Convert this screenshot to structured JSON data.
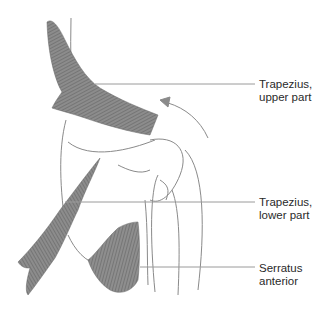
{
  "diagram": {
    "colors": {
      "muscle": "#7a7a7a",
      "outline": "#8a8a8a",
      "leader": "#9a9a9a",
      "text": "#2a2a2a"
    },
    "labels": [
      {
        "id": "trapezius-upper",
        "line1": "Trapezius,",
        "line2": "upper part",
        "top": 78
      },
      {
        "id": "trapezius-lower",
        "line1": "Trapezius,",
        "line2": "lower part",
        "top": 196
      },
      {
        "id": "serratus-anterior",
        "line1": "Serratus",
        "line2": "anterior",
        "top": 262
      }
    ],
    "annotations": [
      {
        "id": "rotation-arrow",
        "description": "curved arrow indicating upward rotation of scapula"
      }
    ]
  }
}
